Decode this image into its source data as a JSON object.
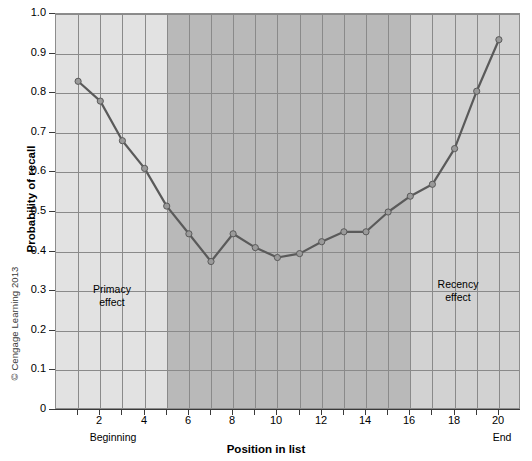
{
  "figure": {
    "copyright": "© Cengage Learning 2013"
  },
  "chart_data": {
    "type": "line",
    "title": "",
    "xlabel": "Position in list",
    "ylabel": "Probability of recall",
    "x": [
      1,
      2,
      3,
      4,
      5,
      6,
      7,
      8,
      9,
      10,
      11,
      12,
      13,
      14,
      15,
      16,
      17,
      18,
      19,
      20
    ],
    "values": [
      0.83,
      0.78,
      0.68,
      0.61,
      0.515,
      0.445,
      0.375,
      0.445,
      0.41,
      0.385,
      0.395,
      0.425,
      0.45,
      0.45,
      0.5,
      0.54,
      0.57,
      0.66,
      0.805,
      0.935
    ],
    "series": [
      {
        "name": "Probability of recall",
        "values": [
          0.83,
          0.78,
          0.68,
          0.61,
          0.515,
          0.445,
          0.375,
          0.445,
          0.41,
          0.385,
          0.395,
          0.425,
          0.45,
          0.45,
          0.5,
          0.54,
          0.57,
          0.66,
          0.805,
          0.935
        ]
      }
    ],
    "xlim": [
      0,
      21
    ],
    "ylim": [
      0,
      1.0
    ],
    "xticks": [
      2,
      4,
      6,
      8,
      10,
      12,
      14,
      16,
      18,
      20
    ],
    "xtick_labels": [
      "2",
      "4",
      "6",
      "8",
      "10",
      "12",
      "14",
      "16",
      "18",
      "20"
    ],
    "yticks": [
      0,
      0.1,
      0.2,
      0.3,
      0.4,
      0.5,
      0.6,
      0.7,
      0.8,
      0.9,
      1.0
    ],
    "ytick_labels": [
      "0",
      "0.1",
      "0.2",
      "0.3",
      "0.4",
      "0.5",
      "0.6",
      "0.7",
      "0.8",
      "0.9",
      "1.0"
    ],
    "grid": true,
    "legend": "none",
    "axis_edge_labels": {
      "left": "Beginning",
      "right": "End"
    },
    "annotations": [
      {
        "id": "primacy",
        "line1": "Primacy",
        "line2": "effect"
      },
      {
        "id": "recency",
        "line1": "Recency",
        "line2": "effect"
      }
    ],
    "bands": [
      {
        "id": "primacy-band",
        "from": 0,
        "to": 5,
        "color": "#e2e2e2"
      },
      {
        "id": "middle-band",
        "from": 5,
        "to": 16,
        "color": "#b9b9b9"
      },
      {
        "id": "recency-band",
        "from": 16,
        "to": 21,
        "color": "#d2d2d2"
      }
    ],
    "colors": {
      "line": "#5a5a5a",
      "marker": "#9a9a9a",
      "grid": "#8a8a8a",
      "axis": "#3a3a3a"
    }
  }
}
